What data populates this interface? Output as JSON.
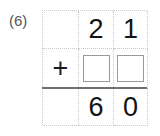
{
  "problem": {
    "number_label": "(6)",
    "type": "vertical-addition",
    "operator": "+",
    "top_addend": "21",
    "bottom_addend_blank": true,
    "sum": "60"
  },
  "grid": {
    "columns": 3,
    "rows": 3,
    "rule_color": "#6f6f70",
    "gridline_color": "#c8c8c8",
    "answer_box_border_color": "#9a9a9a",
    "digit_color": "#131313",
    "label_color": "#555558",
    "background": "#ffffff"
  },
  "rows": [
    {
      "name": "top-addend-row",
      "cells": [
        {
          "name": "operator-cell",
          "text": ""
        },
        {
          "name": "tens-digit",
          "text": "2"
        },
        {
          "name": "ones-digit",
          "text": "1"
        }
      ]
    },
    {
      "name": "bottom-addend-row",
      "cells": [
        {
          "name": "operator-cell",
          "text": "+"
        },
        {
          "name": "tens-answer-box",
          "text": ""
        },
        {
          "name": "ones-answer-box",
          "text": ""
        }
      ]
    },
    {
      "name": "sum-row",
      "cells": [
        {
          "name": "operator-cell",
          "text": ""
        },
        {
          "name": "tens-digit",
          "text": "6"
        },
        {
          "name": "ones-digit",
          "text": "0"
        }
      ]
    }
  ]
}
